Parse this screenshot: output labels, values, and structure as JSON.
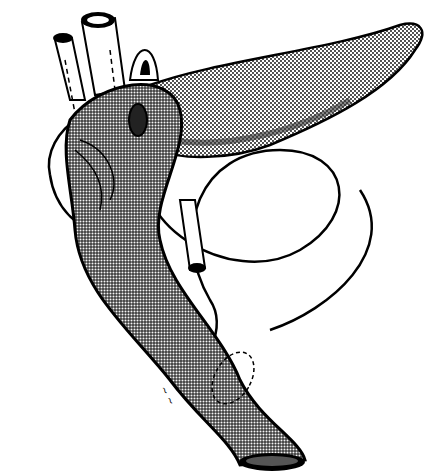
{
  "illustration": {
    "subject": "anatomical drawing of pancreas with surrounding bowel loop and vessels",
    "style": "black-and-white stippled pen illustration",
    "colors": {
      "background": "#ffffff",
      "ink": "#000000",
      "stipple_dark": "#555555",
      "stipple_light": "#bbbbbb"
    },
    "signature": "~ ~"
  }
}
